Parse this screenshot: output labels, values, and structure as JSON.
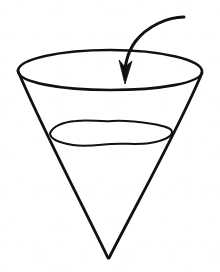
{
  "figure": {
    "background_color": "#ffffff",
    "ink_color": "#111111",
    "canvas": {
      "width": 220,
      "height": 272
    },
    "caption": ""
  },
  "shapes": {
    "cone_rim": {
      "label": "cone rim ellipse",
      "cx": 110,
      "cy": 70,
      "rx": 93,
      "ry": 20,
      "stroke_width": 2.6
    },
    "cone_left_wall": {
      "label": "cone left slanted wall",
      "x1": 18,
      "y1": 72,
      "x2": 108,
      "y2": 258,
      "stroke_width": 2.8
    },
    "cone_right_wall": {
      "label": "cone right slanted wall",
      "x1": 202,
      "y1": 73,
      "x2": 109,
      "y2": 258,
      "stroke_width": 2.8
    },
    "cone_apex": {
      "label": "cone apex point",
      "x": 108,
      "y": 258
    },
    "liquid_surface": {
      "label": "wavy liquid surface ellipse",
      "cx": 111,
      "cy": 132,
      "rx": 61,
      "ry": 15,
      "stroke_width": 2.0,
      "wavy": true
    },
    "pour_arrow": {
      "label": "curved pouring arrow",
      "path": "M 183 17 C 168 18 146 27 134 43 C 126 54 124 68 125 79",
      "stroke_width": 3.0,
      "head_tip": {
        "x": 125,
        "y": 83
      },
      "head_width": 11,
      "head_length": 22,
      "direction": "down-into-cone"
    }
  },
  "annotations": {
    "labels": []
  }
}
